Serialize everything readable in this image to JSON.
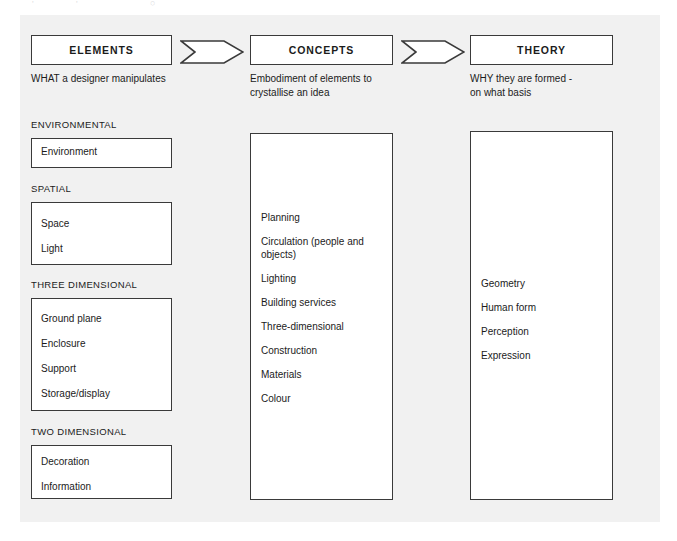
{
  "page": {
    "background_color": "#f1f1f1",
    "canvas_color": "#ffffff",
    "line_color": "#3a3a3a"
  },
  "columns": [
    {
      "id": "elements",
      "header": "ELEMENTS",
      "subtitle": "WHAT a designer manipulates"
    },
    {
      "id": "concepts",
      "header": "CONCEPTS",
      "subtitle": "Embodiment of elements to\ncrystallise an idea"
    },
    {
      "id": "theory",
      "header": "THEORY",
      "subtitle": "WHY they are formed -\non what basis"
    }
  ],
  "arrows": [
    {
      "id": "arrow-elements-to-concepts",
      "glyph": "chevron-right"
    },
    {
      "id": "arrow-concepts-to-theory",
      "glyph": "chevron-right"
    }
  ],
  "elements_groups": [
    {
      "label": "ENVIRONMENTAL",
      "items": [
        "Environment"
      ]
    },
    {
      "label": "SPATIAL",
      "items": [
        "Space",
        "Light"
      ]
    },
    {
      "label": "THREE DIMENSIONAL",
      "items": [
        "Ground plane",
        "Enclosure",
        "Support",
        "Storage/display"
      ]
    },
    {
      "label": "TWO DIMENSIONAL",
      "items": [
        "Decoration",
        "Information"
      ]
    }
  ],
  "concepts_items": [
    "Planning",
    "Circulation (people and objects)",
    "Lighting",
    "Building services",
    "Three-dimensional",
    "Construction",
    "Materials",
    "Colour"
  ],
  "theory_items": [
    "Geometry",
    "Human form",
    "Perception",
    "Expression"
  ],
  "ghost_marks": [
    "'",
    "'",
    "○"
  ]
}
